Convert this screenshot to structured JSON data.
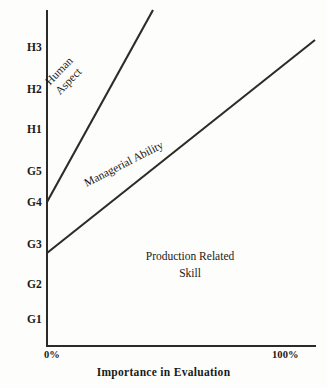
{
  "chart_data": {
    "type": "line",
    "title": "",
    "xlabel": "Importance in Evaluation",
    "ylabel": "",
    "grid": false,
    "legend": "none",
    "x_ticks": [
      "0%",
      "100%"
    ],
    "xlim": [
      0,
      100
    ],
    "y_ticks": [
      "G1",
      "G2",
      "G3",
      "G4",
      "G5",
      "H1",
      "H2",
      "H3"
    ],
    "ylim": [
      "G1",
      "H3"
    ],
    "series": [
      {
        "name": "Human Aspect",
        "points": [
          {
            "x": 0,
            "y": "G4"
          },
          {
            "x": 39,
            "y": "above H3"
          }
        ]
      },
      {
        "name": "Managerial Ability",
        "points": [
          {
            "x": 0,
            "y": "between G2 and G3"
          },
          {
            "x": 100,
            "y": "above H3"
          }
        ]
      }
    ],
    "regions": [
      {
        "name": "Human Aspect",
        "label": "Human\nAspect"
      },
      {
        "name": "Managerial Ability",
        "label": "Managerial Ability"
      },
      {
        "name": "Production Related Skill",
        "label": "Production Related Skill"
      }
    ]
  },
  "axis": {
    "y_ticks": [
      {
        "label": "H3",
        "top": 42
      },
      {
        "label": "H2",
        "top": 84
      },
      {
        "label": "H1",
        "top": 124
      },
      {
        "label": "G5",
        "top": 166
      },
      {
        "label": "G4",
        "top": 197
      },
      {
        "label": "G3",
        "top": 239
      },
      {
        "label": "G2",
        "top": 279
      },
      {
        "label": "G1",
        "top": 314
      }
    ],
    "x_left_label": "0%",
    "x_right_label": "100%",
    "x_title": "Importance in Evaluation"
  },
  "regions": {
    "human_line1": "Human",
    "human_line2": "Aspect",
    "managerial": "Managerial Ability",
    "production_line1": "Production Related",
    "production_line2": "Skill"
  },
  "colors": {
    "ink": "#2b2b28",
    "background": "#fdfdfb"
  }
}
